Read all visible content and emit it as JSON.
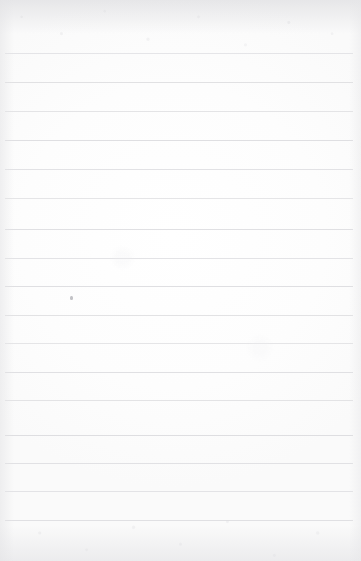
{
  "page": {
    "kind": "scanned-blank-lined-notebook-page",
    "title": "",
    "width_px": 361,
    "height_px": 561,
    "background_color": "#fdfdfd",
    "paper_tone": "#ffffff",
    "text_content": "",
    "has_writing": false,
    "has_header_text": false,
    "has_page_number": false,
    "has_margin_rule": false
  },
  "ruling": {
    "line_color": "#dedee1",
    "line_thickness_px": 1,
    "line_count": 17,
    "line_left_px": 5,
    "line_right_px": 353,
    "line_spacing_px": 29,
    "first_line_y_px": 53,
    "last_line_y_px": 520,
    "line_y_positions": [
      53,
      82,
      111,
      140,
      169,
      198,
      229,
      258,
      286,
      315,
      343,
      372,
      400,
      435,
      463,
      491,
      520
    ]
  },
  "marks": [
    {
      "name": "dust-speck",
      "x_px": 70,
      "y_px": 296,
      "width_px": 3,
      "height_px": 4,
      "color": "#b8b8bd"
    }
  ],
  "texture": {
    "edge_shading": "true",
    "speckle_zones": [
      "top-edge",
      "bottom-edge"
    ],
    "vignette_color": "#e2e2e5"
  }
}
